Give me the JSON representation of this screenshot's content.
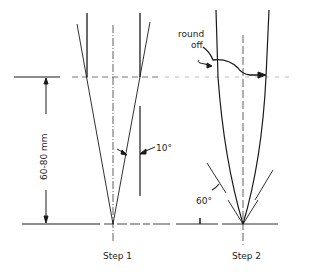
{
  "diagram": {
    "dimension_label": "60-80 mm",
    "step1": {
      "label": "Step 1",
      "angle_label": "10°"
    },
    "step2": {
      "label": "Step 2",
      "angle_label": "60°",
      "annotation": [
        "round",
        "off"
      ]
    }
  },
  "colors": {
    "line": "#1a1a1a",
    "background": "#ffffff"
  }
}
